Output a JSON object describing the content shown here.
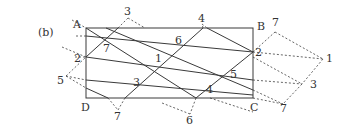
{
  "panel_label": "(b)",
  "corners": {
    "A": {
      "label": "A",
      "x": 86,
      "y": 28
    },
    "B": {
      "label": "B",
      "x": 253,
      "y": 28
    },
    "C": {
      "label": "C",
      "x": 253,
      "y": 98
    },
    "D": {
      "label": "D",
      "x": 86,
      "y": 98
    }
  },
  "interior_labels": [
    {
      "text": "7",
      "x": 103,
      "y": 52
    },
    {
      "text": "6",
      "x": 175,
      "y": 44
    },
    {
      "text": "1",
      "x": 155,
      "y": 62
    },
    {
      "text": "3",
      "x": 133,
      "y": 86
    },
    {
      "text": "5",
      "x": 230,
      "y": 78
    },
    {
      "text": "4",
      "x": 206,
      "y": 93
    }
  ],
  "edge_labels": [
    {
      "text": "2",
      "x": 74,
      "y": 62
    },
    {
      "text": "2",
      "x": 255,
      "y": 56
    }
  ],
  "outer_labels": [
    {
      "text": "3",
      "x": 124,
      "y": 15
    },
    {
      "text": "4",
      "x": 198,
      "y": 22
    },
    {
      "text": "7",
      "x": 272,
      "y": 26
    },
    {
      "text": "1",
      "x": 326,
      "y": 62
    },
    {
      "text": "3",
      "x": 310,
      "y": 88
    },
    {
      "text": "7",
      "x": 280,
      "y": 112
    },
    {
      "text": "6",
      "x": 186,
      "y": 124
    },
    {
      "text": "7",
      "x": 114,
      "y": 120
    },
    {
      "text": "5",
      "x": 57,
      "y": 84
    }
  ],
  "solid_lines": [
    [
      86,
      28,
      196,
      98
    ],
    [
      86,
      36,
      253,
      52
    ],
    [
      86,
      57,
      253,
      80
    ],
    [
      86,
      80,
      253,
      95
    ],
    [
      86,
      88,
      108,
      98
    ],
    [
      118,
      28,
      86,
      57
    ],
    [
      125,
      98,
      203,
      28
    ],
    [
      207,
      28,
      253,
      52
    ],
    [
      196,
      98,
      253,
      52
    ],
    [
      106,
      28,
      253,
      90
    ]
  ],
  "dashed_lines": [
    [
      72,
      20,
      86,
      28
    ],
    [
      76,
      36,
      86,
      36
    ],
    [
      62,
      47,
      86,
      57
    ],
    [
      75,
      57,
      86,
      57
    ],
    [
      66,
      76,
      86,
      57
    ],
    [
      66,
      76,
      86,
      80
    ],
    [
      66,
      76,
      86,
      88
    ],
    [
      108,
      98,
      118,
      110
    ],
    [
      118,
      110,
      125,
      98
    ],
    [
      118,
      28,
      128,
      18
    ],
    [
      128,
      18,
      145,
      28
    ],
    [
      196,
      98,
      190,
      114
    ],
    [
      190,
      114,
      162,
      103
    ],
    [
      203,
      28,
      202,
      24
    ],
    [
      202,
      24,
      207,
      28
    ],
    [
      253,
      52,
      275,
      32
    ],
    [
      275,
      32,
      323,
      59
    ],
    [
      253,
      52,
      323,
      59
    ],
    [
      323,
      59,
      302,
      84
    ],
    [
      253,
      57,
      302,
      84
    ],
    [
      253,
      80,
      302,
      84
    ],
    [
      302,
      84,
      283,
      104
    ],
    [
      253,
      90,
      283,
      104
    ],
    [
      253,
      98,
      283,
      104
    ],
    [
      210,
      98,
      253,
      112
    ]
  ]
}
